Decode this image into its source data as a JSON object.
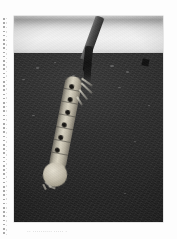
{
  "page": {
    "background_color": "#fdfdfd",
    "margin_guide": {
      "name": "dotted-margin-rule",
      "color": "#8d8d8d"
    }
  },
  "figure": {
    "alt": "Black-and-white photograph of a mosquito larva hanging head-down from a twig at the water surface",
    "frame_color": "#2b2b2b",
    "regions": {
      "sky_label": "sky",
      "sky_color": "#ececec",
      "horizon_haze_color": "#787878",
      "water_label": "dark water",
      "water_color": "#2e2e2e",
      "waterline_color": "#e1e1e1"
    },
    "subjects": [
      {
        "name": "twig",
        "color": "#4a4a4a"
      },
      {
        "name": "siphon",
        "color": "#141414"
      },
      {
        "name": "larva-abdomen",
        "color": "#d8d3c2"
      },
      {
        "name": "larva-head",
        "color": "#c5bfae"
      },
      {
        "name": "body-spots",
        "count": 6,
        "color": "#151310"
      },
      {
        "name": "lateral-tufts",
        "count": 4,
        "color": "#e1ded0"
      },
      {
        "name": "debris",
        "color": "#111111"
      }
    ]
  },
  "caption": {
    "text": "·· ·········· ····· ·",
    "legible": "false",
    "color": "#8a8a8a"
  }
}
